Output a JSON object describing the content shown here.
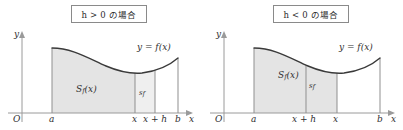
{
  "figure": {
    "background": "#ffffff",
    "curve_color": "#3a3a3a",
    "axis_color": "#9a9a9a",
    "fill_main": "#e4e4e4",
    "fill_strip": "#efefef",
    "box_border": "#8a8a8a"
  },
  "panels": [
    {
      "id": "panel-h-positive",
      "caption": "h > 0 の場合",
      "caption_parts": {
        "variable": "h",
        "relation": ">",
        "value": "0",
        "suffix": "の場合"
      },
      "axes": {
        "origin_label": "O",
        "y_axis_label": "y",
        "x_axis_label": "x"
      },
      "curve_label": "y = f(x)",
      "region_labels": {
        "main_area": "S_f(x)",
        "main_area_base": "S",
        "main_area_sub": "f",
        "main_area_arg": "(x)",
        "strip_area": "s_f",
        "strip_area_base": "s",
        "strip_area_sub": "f"
      },
      "x_ticks": [
        {
          "label": "a",
          "kind": "simple"
        },
        {
          "label": "x",
          "kind": "simple"
        },
        {
          "label": "x + h",
          "kind": "compound"
        },
        {
          "label": "b",
          "kind": "simple"
        }
      ]
    },
    {
      "id": "panel-h-negative",
      "caption": "h < 0 の場合",
      "caption_parts": {
        "variable": "h",
        "relation": "<",
        "value": "0",
        "suffix": "の場合"
      },
      "axes": {
        "origin_label": "O",
        "y_axis_label": "y",
        "x_axis_label": "x"
      },
      "curve_label": "y = f(x)",
      "region_labels": {
        "main_area": "S_f(x)",
        "main_area_base": "S",
        "main_area_sub": "f",
        "main_area_arg": "(x)",
        "strip_area": "s_f",
        "strip_area_base": "s",
        "strip_area_sub": "f"
      },
      "x_ticks": [
        {
          "label": "a",
          "kind": "simple"
        },
        {
          "label": "x + h",
          "kind": "compound"
        },
        {
          "label": "x",
          "kind": "simple"
        },
        {
          "label": "b",
          "kind": "simple"
        }
      ]
    }
  ]
}
